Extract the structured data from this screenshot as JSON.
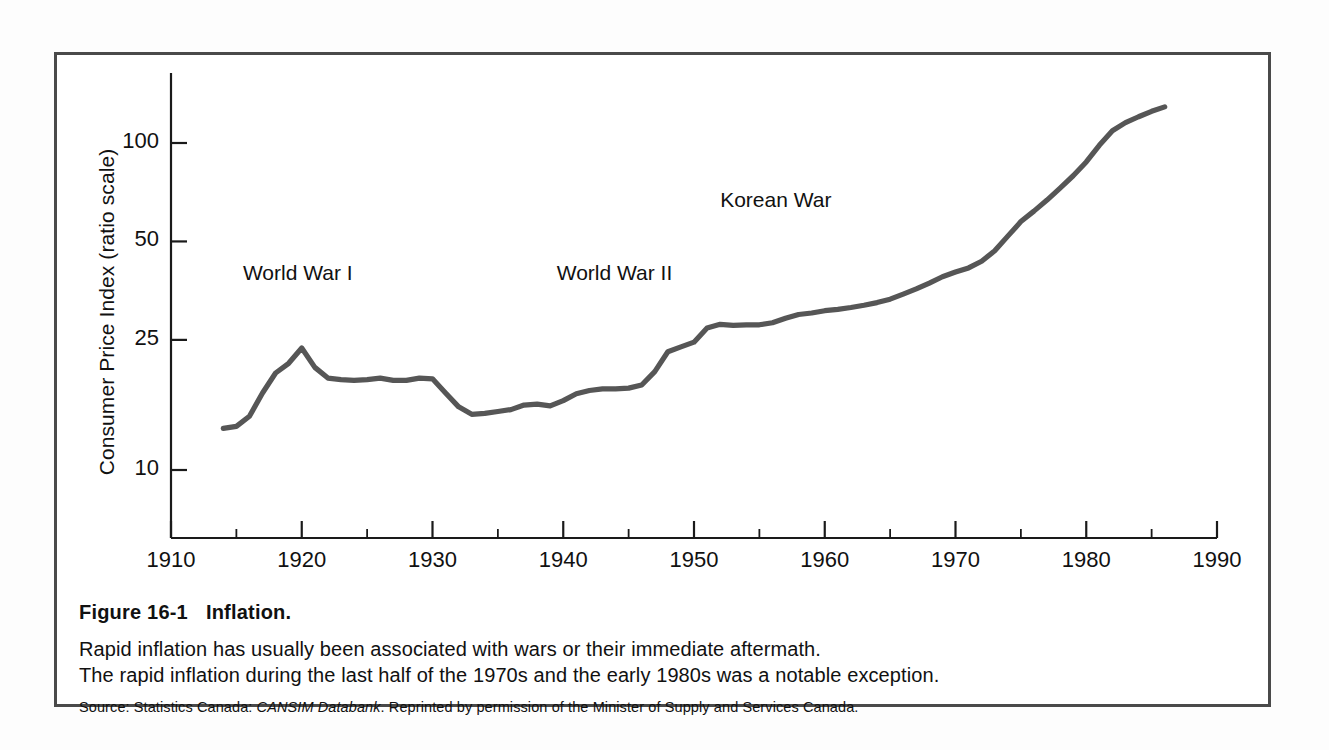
{
  "figure": {
    "title_number": "Figure 16-1",
    "title_text": "Inflation.",
    "caption_line_1": "Rapid inflation has usually been associated with wars or their immediate aftermath.",
    "caption_line_2": "The rapid inflation during the last half of the 1970s and the early 1980s was a notable exception.",
    "source_prefix": "Source: Statistics Canada: ",
    "source_italic": "CANSIM Databank",
    "source_suffix": ". Reprinted by permission of the Minister of Supply and Services Canada."
  },
  "colors": {
    "frame": "#4a4a4a",
    "line": "#565656",
    "axis": "#1a1a1a",
    "text": "#111111",
    "background": "#ffffff"
  },
  "chart_data": {
    "type": "line",
    "title": "Inflation.",
    "xlabel": "",
    "ylabel": "Consumer Price Index (ratio scale)",
    "yscale": "log",
    "ylim": [
      7,
      150
    ],
    "xlim": [
      1910,
      1990
    ],
    "grid": false,
    "legend": "none",
    "ytick_labels": [
      "100",
      "50",
      "25",
      "10"
    ],
    "ytick_values": [
      100,
      50,
      25,
      10
    ],
    "xtick_labels": [
      "1910",
      "1920",
      "1930",
      "1940",
      "1950",
      "1960",
      "1970",
      "1980",
      "1990"
    ],
    "xtick_values": [
      1910,
      1920,
      1930,
      1940,
      1950,
      1960,
      1970,
      1980,
      1990
    ],
    "xminor_step": 5,
    "series": [
      {
        "name": "Consumer Price Index",
        "x": [
          1914,
          1915,
          1916,
          1917,
          1918,
          1919,
          1920,
          1921,
          1922,
          1923,
          1924,
          1925,
          1926,
          1927,
          1928,
          1929,
          1930,
          1931,
          1932,
          1933,
          1934,
          1935,
          1936,
          1937,
          1938,
          1939,
          1940,
          1941,
          1942,
          1943,
          1944,
          1945,
          1946,
          1947,
          1948,
          1949,
          1950,
          1951,
          1952,
          1953,
          1954,
          1955,
          1956,
          1957,
          1958,
          1959,
          1960,
          1961,
          1962,
          1963,
          1964,
          1965,
          1966,
          1967,
          1968,
          1969,
          1970,
          1971,
          1972,
          1973,
          1974,
          1975,
          1976,
          1977,
          1978,
          1979,
          1980,
          1981,
          1982,
          1983,
          1984,
          1985,
          1986
        ],
        "y": [
          13.4,
          13.6,
          14.6,
          17.2,
          19.8,
          21.2,
          23.6,
          20.6,
          19.1,
          18.9,
          18.8,
          18.9,
          19.1,
          18.8,
          18.8,
          19.1,
          19.0,
          17.2,
          15.6,
          14.8,
          14.9,
          15.1,
          15.3,
          15.8,
          15.9,
          15.7,
          16.3,
          17.1,
          17.5,
          17.7,
          17.7,
          17.8,
          18.2,
          20.0,
          23.0,
          23.8,
          24.6,
          27.2,
          27.9,
          27.7,
          27.8,
          27.8,
          28.2,
          29.1,
          29.9,
          30.2,
          30.7,
          31.0,
          31.4,
          31.9,
          32.5,
          33.3,
          34.5,
          35.8,
          37.3,
          39.0,
          40.3,
          41.5,
          43.5,
          46.8,
          51.9,
          57.5,
          61.9,
          66.9,
          72.8,
          79.4,
          87.5,
          98.4,
          109.0,
          115.4,
          120.3,
          125.0,
          129.0
        ]
      }
    ],
    "annotations": [
      {
        "text": "World War I",
        "x": 1915.5,
        "y": 40
      },
      {
        "text": "World War II",
        "x": 1939.5,
        "y": 40
      },
      {
        "text": "Korean War",
        "x": 1952.0,
        "y": 67
      }
    ]
  }
}
